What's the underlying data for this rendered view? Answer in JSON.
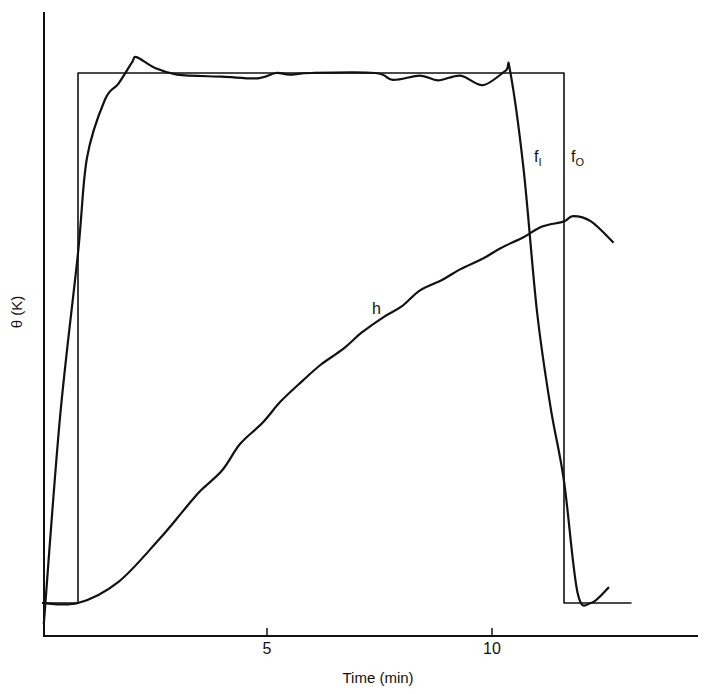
{
  "chart_data": {
    "type": "line",
    "title": "",
    "xlabel": "Time (min)",
    "ylabel": "θ (K)",
    "xlim": [
      0,
      14.7
    ],
    "ylim": [
      -0.06,
      1.1
    ],
    "x_ticks": [
      5,
      10
    ],
    "x_tick_labels": [
      "5",
      "10"
    ],
    "y_ticks": [],
    "grid": false,
    "legend": "none (inline curve labels)",
    "annotations": [
      {
        "text": "f",
        "sub": "I",
        "x": 10.5,
        "y": 0.85
      },
      {
        "text": "f",
        "sub": "O",
        "x": 11.9,
        "y": 0.85
      },
      {
        "text": "h",
        "x": 7.4,
        "y": 0.55
      }
    ],
    "series": [
      {
        "name": "f_O (input square pulse)",
        "t": [
          0.0,
          0.8,
          0.8,
          11.6,
          11.6,
          13.1
        ],
        "theta": [
          0.0,
          0.0,
          1.0,
          1.0,
          0.0,
          0.0
        ]
      },
      {
        "name": "f_I (response)",
        "t": [
          0.04,
          0.4,
          0.8,
          1.0,
          1.4,
          1.7,
          2.0,
          2.1,
          2.5,
          3.0,
          4.0,
          4.8,
          5.2,
          5.5,
          6.0,
          7.4,
          7.8,
          8.4,
          8.8,
          9.3,
          9.8,
          10.3,
          10.4,
          10.7,
          11.0,
          11.3,
          11.6,
          11.9,
          12.2,
          12.6
        ],
        "theta": [
          -0.04,
          0.35,
          0.66,
          0.84,
          0.95,
          0.98,
          1.02,
          1.03,
          1.01,
          0.997,
          0.993,
          0.99,
          1.0,
          0.997,
          1.0,
          1.0,
          0.987,
          0.995,
          0.986,
          0.995,
          0.977,
          1.004,
          1.005,
          0.82,
          0.55,
          0.37,
          0.23,
          0.02,
          0.0,
          0.03
        ]
      },
      {
        "name": "h",
        "t": [
          0.0,
          0.8,
          1.7,
          2.6,
          3.1,
          3.5,
          4.0,
          4.4,
          4.9,
          5.3,
          5.8,
          6.2,
          6.7,
          7.1,
          7.6,
          8.0,
          8.4,
          8.9,
          9.3,
          9.8,
          10.2,
          10.7,
          11.1,
          11.6,
          11.8,
          12.2,
          12.7
        ],
        "theta": [
          0.0,
          0.0,
          0.04,
          0.12,
          0.17,
          0.21,
          0.25,
          0.3,
          0.34,
          0.38,
          0.42,
          0.45,
          0.48,
          0.51,
          0.54,
          0.56,
          0.59,
          0.61,
          0.63,
          0.65,
          0.67,
          0.69,
          0.71,
          0.72,
          0.73,
          0.72,
          0.68
        ]
      }
    ]
  },
  "axes": {
    "x_label": "Time (min)",
    "y_label": "θ (K)",
    "tick_5": "5",
    "tick_10": "10"
  },
  "labels": {
    "f_i_main": "f",
    "f_i_sub": "I",
    "f_o_main": "f",
    "f_o_sub": "O",
    "h": "h"
  },
  "style": {
    "line_color": "#111111",
    "background": "#ffffff"
  }
}
